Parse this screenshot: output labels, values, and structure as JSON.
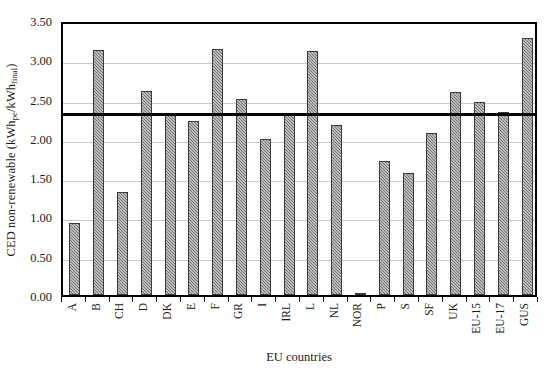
{
  "chart_data": {
    "type": "bar",
    "title": "",
    "xlabel": "EU countries",
    "ylabel": "CED non-renewable (kWh_pe/kWh_final)",
    "ylabel_parts": {
      "prefix": "CED non-renewable (kWh",
      "sub1": "pe",
      "mid": "/kWh",
      "sub2": "final",
      "suffix": ")"
    },
    "categories": [
      "A",
      "B",
      "CH",
      "D",
      "DK",
      "E",
      "F",
      "GR",
      "I",
      "IRL",
      "L",
      "NL",
      "NOR",
      "P",
      "S",
      "SF",
      "UK",
      "EU-15",
      "EU-17",
      "GUS"
    ],
    "values": [
      0.92,
      3.12,
      1.31,
      2.6,
      2.29,
      2.21,
      3.13,
      2.49,
      1.98,
      2.31,
      3.11,
      2.17,
      0.02,
      1.7,
      1.55,
      2.06,
      2.58,
      2.46,
      2.33,
      3.27
    ],
    "ylim": [
      0.0,
      3.5
    ],
    "ytick_values": [
      0.0,
      0.5,
      1.0,
      1.5,
      2.0,
      2.5,
      3.0,
      3.5
    ],
    "ytick_labels": [
      "0.00",
      "0.50",
      "1.00",
      "1.50",
      "2.00",
      "2.50",
      "3.00",
      "3.50"
    ],
    "grid": true,
    "legend": "none",
    "reference_line": {
      "value": 2.35,
      "orientation": "horizontal",
      "color": "#000000",
      "label": ""
    },
    "series": [
      {
        "name": "CED non-renewable",
        "color": "#6f6f6f",
        "pattern": "hatched",
        "values": [
          0.92,
          3.12,
          1.31,
          2.6,
          2.29,
          2.21,
          3.13,
          2.49,
          1.98,
          2.31,
          3.11,
          2.17,
          0.02,
          1.7,
          1.55,
          2.06,
          2.58,
          2.46,
          2.33,
          3.27
        ]
      }
    ]
  },
  "colors": {
    "bar_fill": "#6f6f6f",
    "bar_edge": "#3a3a3a",
    "grid": "#c9c9c9",
    "axis": "#000000",
    "background": "#ffffff"
  }
}
